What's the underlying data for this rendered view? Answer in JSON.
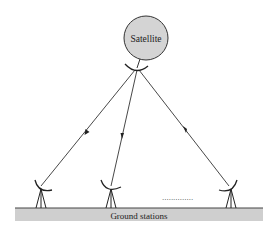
{
  "diagram": {
    "satellite": {
      "label": "Satellite",
      "cx": 146,
      "cy": 38,
      "r": 22,
      "fill": "#d4d4d4",
      "stroke": "#333333",
      "dish": {
        "x": 135,
        "y": 68
      }
    },
    "ground": {
      "label": "Ground stations",
      "x": 15,
      "y": 208,
      "width": 248,
      "height": 13,
      "fill": "#cfcfcf",
      "stroke": "#555555"
    },
    "stations": [
      {
        "id": "station-1",
        "x": 40,
        "dish_y": 188
      },
      {
        "id": "station-2",
        "x": 110,
        "dish_y": 188
      },
      {
        "id": "station-3",
        "x": 230,
        "dish_y": 188
      }
    ],
    "links": [
      {
        "from": "satellite",
        "to": "station-1",
        "arrow": "down"
      },
      {
        "from": "satellite",
        "to": "station-2",
        "arrow": "down"
      },
      {
        "from": "satellite",
        "to": "station-3",
        "arrow": "down"
      }
    ],
    "ellipsis": {
      "text": "..............",
      "x": 162,
      "y": 199
    }
  }
}
